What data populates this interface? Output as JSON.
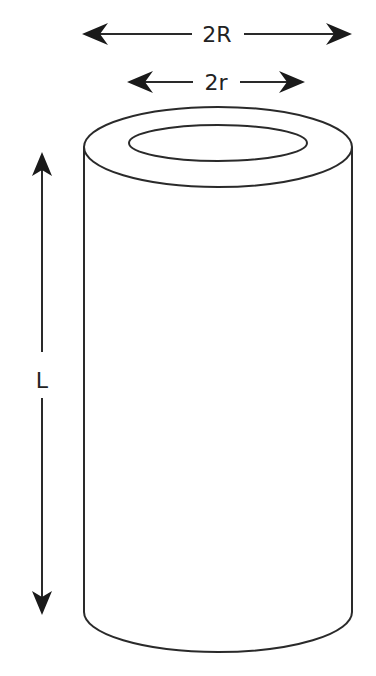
{
  "diagram": {
    "labels": {
      "outer_diameter": "2R",
      "inner_diameter": "2r",
      "length": "L"
    },
    "colors": {
      "stroke": "#2a2a2a",
      "arrowhead": "#1a1a1a",
      "text": "#222222",
      "background": "#ffffff"
    }
  }
}
